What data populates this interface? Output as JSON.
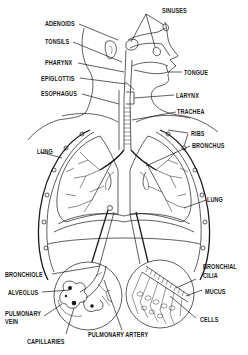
{
  "diagram": {
    "labels": {
      "sinuses": "SINUSES",
      "adenoids": "ADENOIDS",
      "tonsils": "TONSILS",
      "pharynx": "PHARYNX",
      "epiglottis": "EPIGLOTTIS",
      "esophagus": "ESOPHAGUS",
      "tongue": "TONGUE",
      "larynx": "LARYNX",
      "trachea": "TRACHEA",
      "ribs": "RIBS",
      "bronchus": "BRONCHUS",
      "lung_left": "LUNG",
      "lung_right": "LUNG",
      "bronchiole": "BRONCHIOLE",
      "alveolus": "ALVEOLUS",
      "pulmonary_vein_line1": "PULMONARY",
      "pulmonary_vein_line2": "VEIN",
      "capillaries": "CAPILLARIES",
      "pulmonary_artery": "PULMONARY ARTERY",
      "bronchial_cilia_line1": "BRONCHIAL",
      "bronchial_cilia_line2": "CILIA",
      "mucus": "MUCUS",
      "cells": "CELLS"
    },
    "insets": [
      {
        "name": "alveolus-detail",
        "labels": [
          "BRONCHIOLE",
          "ALVEOLUS",
          "PULMONARY VEIN",
          "CAPILLARIES",
          "PULMONARY ARTERY"
        ]
      },
      {
        "name": "bronchial-lining-detail",
        "labels": [
          "BRONCHIAL CILIA",
          "MUCUS",
          "CELLS"
        ]
      }
    ],
    "colors": {
      "ink": "#1a1a1a",
      "background": "#ffffff"
    }
  }
}
